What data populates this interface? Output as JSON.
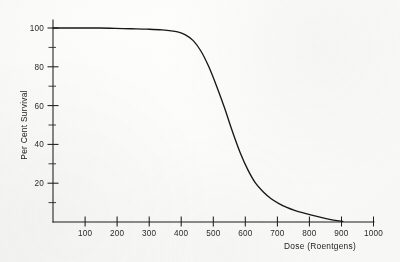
{
  "figure": {
    "background_color": "#fbfbfa",
    "ink_color": "#171717"
  },
  "chart_data": {
    "type": "line",
    "title": "",
    "xlabel": "Dose (Roentgens)",
    "ylabel": "Per Cent Survival",
    "xlim": [
      0,
      1030
    ],
    "ylim": [
      0,
      104
    ],
    "grid": false,
    "legend": null,
    "x_ticks": [
      100,
      200,
      300,
      400,
      500,
      600,
      700,
      800,
      900,
      1000
    ],
    "x_tick_labels": [
      "100",
      "200",
      "300",
      "400",
      "500",
      "600",
      "700",
      "800",
      "900",
      "1000"
    ],
    "x_minor_ticks": [],
    "y_ticks": [
      20,
      40,
      60,
      80,
      100
    ],
    "y_tick_labels": [
      "20",
      "40",
      "60",
      "80",
      "100"
    ],
    "y_minor_ticks": [
      10,
      30,
      50,
      70,
      90
    ],
    "series": [
      {
        "name": "Per Cent Survival vs Dose",
        "x": [
          0,
          50,
          100,
          150,
          200,
          250,
          300,
          350,
          400,
          425,
          450,
          475,
          500,
          525,
          550,
          575,
          600,
          625,
          650,
          675,
          700,
          725,
          750,
          775,
          800,
          850,
          900,
          930
        ],
        "y": [
          100,
          100,
          100,
          100,
          99.8,
          99.6,
          99.4,
          99.0,
          98.0,
          96.5,
          93.5,
          88.0,
          80.0,
          70.0,
          59.0,
          47.0,
          36.0,
          27.0,
          20.0,
          15.5,
          12.0,
          9.5,
          7.5,
          6.0,
          4.8,
          2.8,
          1.0,
          0.3
        ]
      }
    ],
    "annotations": []
  },
  "axis": {
    "x_title": "Dose (Roentgens)",
    "y_title": "Per Cent Survival"
  }
}
